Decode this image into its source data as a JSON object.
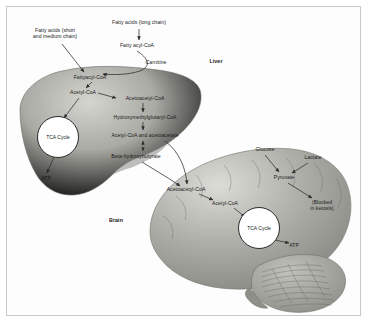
{
  "figure": {
    "type": "biochemical-pathway-diagram",
    "title_visible": false,
    "background": "#ffffff",
    "frame_color": "#c8c8c8"
  },
  "colors": {
    "liver_light": "#c9c9c4",
    "liver_mid": "#9d9d97",
    "liver_dark": "#777772",
    "brain_light": "#d2d2cd",
    "brain_mid": "#a8a8a2",
    "brain_dark": "#83837d",
    "cerebellum": "#9b9b95",
    "stroke": "#2b2b2b",
    "text": "#1a1a1a"
  },
  "organs": [
    {
      "name": "liver",
      "label": "Liver",
      "label_x": 216,
      "label_y": 62
    },
    {
      "name": "brain",
      "label": "Brain",
      "label_x": 116,
      "label_y": 221
    }
  ],
  "nodes": [
    {
      "id": "fa-short",
      "label": "Fatty acids (short\nand medium chain)",
      "x": 55,
      "y": 33,
      "align": "center",
      "compartment": "external"
    },
    {
      "id": "fa-long",
      "label": "Fatty acids (long chain)",
      "x": 139,
      "y": 24,
      "align": "center",
      "compartment": "external"
    },
    {
      "id": "fatty-acyl-coa",
      "label": "Fatty acyl-CoA",
      "x": 137,
      "y": 46,
      "align": "center",
      "compartment": "external"
    },
    {
      "id": "carnitine",
      "label": "Carnitine",
      "x": 156,
      "y": 62,
      "align": "center",
      "compartment": "external"
    },
    {
      "id": "fattyacyl-coa",
      "label": "Fattyacyl-CoA",
      "x": 90,
      "y": 78,
      "align": "center",
      "compartment": "liver"
    },
    {
      "id": "acetyl-coa-l",
      "label": "Acetyl-CoA",
      "x": 83,
      "y": 93,
      "align": "center",
      "compartment": "liver"
    },
    {
      "id": "acetoacetyl-l",
      "label": "Acetoacetyl-CoA",
      "x": 143,
      "y": 99,
      "align": "center",
      "compartment": "liver"
    },
    {
      "id": "hmg-coa",
      "label": "Hydroxymethylglutaryl-CoA",
      "x": 143,
      "y": 118,
      "align": "center",
      "compartment": "liver"
    },
    {
      "id": "acac",
      "label": "Acetyl-CoA and acetoacetate",
      "x": 143,
      "y": 136,
      "align": "center",
      "compartment": "liver"
    },
    {
      "id": "bhb",
      "label": "Beta-hydroxybutyrate",
      "x": 134,
      "y": 157,
      "align": "center",
      "compartment": "liver"
    },
    {
      "id": "tca-liver",
      "label": "TCA Cycle",
      "x": 58,
      "y": 137,
      "align": "center",
      "compartment": "liver",
      "shape": "circle",
      "r": 20
    },
    {
      "id": "atp-liver",
      "label": "ATP",
      "x": 46,
      "y": 179,
      "align": "center",
      "compartment": "liver"
    },
    {
      "id": "acetoacetyl-b",
      "label": "Acetoacetyl-CoA",
      "x": 186,
      "y": 190,
      "align": "center",
      "compartment": "brain"
    },
    {
      "id": "acetyl-coa-b",
      "label": "Acetyl-CoA",
      "x": 225,
      "y": 204,
      "align": "center",
      "compartment": "brain"
    },
    {
      "id": "glucose",
      "label": "Glucose",
      "x": 265,
      "y": 150,
      "align": "center",
      "compartment": "external"
    },
    {
      "id": "lactate",
      "label": "Lactate",
      "x": 313,
      "y": 158,
      "align": "center",
      "compartment": "external"
    },
    {
      "id": "pyruvate",
      "label": "Pyruvate",
      "x": 284,
      "y": 178,
      "align": "center",
      "compartment": "brain"
    },
    {
      "id": "blocked",
      "label": "(Blocked\nin ketosis)",
      "x": 322,
      "y": 205,
      "align": "center",
      "compartment": "brain"
    },
    {
      "id": "tca-brain",
      "label": "TCA Cycle",
      "x": 259,
      "y": 228,
      "align": "center",
      "compartment": "brain",
      "shape": "circle",
      "r": 20
    },
    {
      "id": "atp-brain",
      "label": "ATP",
      "x": 294,
      "y": 246,
      "align": "center",
      "compartment": "brain"
    }
  ],
  "edges": [
    {
      "from": "fa-short",
      "to": "fattyacyl-coa",
      "style": "solid",
      "arrow": "single"
    },
    {
      "from": "fa-long",
      "to": "fatty-acyl-coa",
      "style": "solid",
      "arrow": "single"
    },
    {
      "from": "fatty-acyl-coa",
      "to": "fattyacyl-coa",
      "style": "curved",
      "arrow": "single",
      "note": "carnitine shuttle"
    },
    {
      "from": "fattyacyl-coa",
      "to": "acetyl-coa-l",
      "style": "solid",
      "arrow": "single"
    },
    {
      "from": "acetyl-coa-l",
      "to": "acetoacetyl-l",
      "style": "solid",
      "arrow": "single"
    },
    {
      "from": "acetyl-coa-l",
      "to": "tca-liver",
      "style": "solid",
      "arrow": "single"
    },
    {
      "from": "acetoacetyl-l",
      "to": "hmg-coa",
      "style": "solid",
      "arrow": "single"
    },
    {
      "from": "hmg-coa",
      "to": "acac",
      "style": "solid",
      "arrow": "single"
    },
    {
      "from": "acac",
      "to": "bhb",
      "style": "dotted",
      "arrow": "double"
    },
    {
      "from": "tca-liver",
      "to": "atp-liver",
      "style": "solid",
      "arrow": "single"
    },
    {
      "from": "acac",
      "to": "acetoacetyl-b",
      "style": "solid",
      "arrow": "single",
      "note": "ketone transport to brain"
    },
    {
      "from": "bhb",
      "to": "acetoacetyl-b",
      "style": "solid",
      "arrow": "single",
      "note": "ketone transport to brain"
    },
    {
      "from": "acetoacetyl-b",
      "to": "acetyl-coa-b",
      "style": "solid",
      "arrow": "single"
    },
    {
      "from": "acetyl-coa-b",
      "to": "tca-brain",
      "style": "solid",
      "arrow": "single"
    },
    {
      "from": "glucose",
      "to": "pyruvate",
      "style": "solid",
      "arrow": "single"
    },
    {
      "from": "lactate",
      "to": "pyruvate",
      "style": "solid",
      "arrow": "single"
    },
    {
      "from": "pyruvate",
      "to": "blocked",
      "style": "solid",
      "arrow": "single",
      "note": "blocked in ketosis"
    },
    {
      "from": "tca-brain",
      "to": "atp-brain",
      "style": "solid",
      "arrow": "single"
    }
  ]
}
